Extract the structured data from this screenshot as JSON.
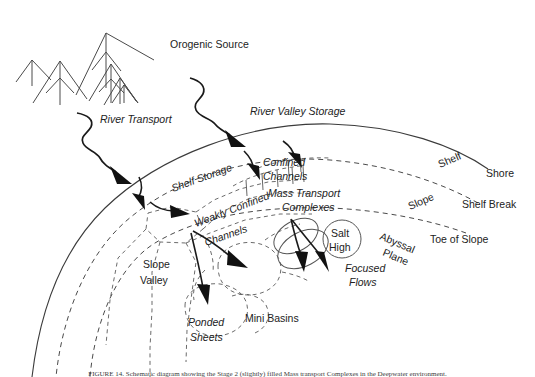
{
  "figure": {
    "caption": "FIGURE 14. Schematic diagram showing the Stage 2 (slightly) filled Mass transport Complexes in the Deepwater environment.",
    "colors": {
      "line": "#3b3b3b",
      "dashed": "#4a4a4a",
      "arrow": "#111111",
      "text": "#222222",
      "background": "#ffffff"
    }
  },
  "labels": {
    "orogenic_source": "Orogenic Source",
    "river_transport": "River Transport",
    "river_valley_storage": "River Valley Storage",
    "shelf_storage": "Shelf Storage",
    "confined_channels_line1": "Confined",
    "confined_channels_line2": "Channels",
    "mass_transport_line1": "Mass Transport",
    "mass_transport_line2": "Complexes",
    "weakly_confined_line1": "Weakly Confined",
    "weakly_confined_line2": "Channels",
    "slope_valley_line1": "Slope",
    "slope_valley_line2": "Valley",
    "ponded_sheets_line1": "Ponded",
    "ponded_sheets_line2": "Sheets",
    "mini_basins": "Mini Basins",
    "salt_high_line1": "Salt",
    "salt_high_line2": "High",
    "focused_flows_line1": "Focused",
    "focused_flows_line2": "Flows",
    "abyssal_plane_line1": "Abyssal",
    "abyssal_plane_line2": "Plane",
    "shelf": "Shelf",
    "shore": "Shore",
    "slope": "Slope",
    "shelf_break": "Shelf Break",
    "toe_of_slope": "Toe of Slope"
  },
  "zones": [
    {
      "name": "Shore",
      "type": "boundary-arc",
      "style": "solid"
    },
    {
      "name": "Shelf",
      "type": "region",
      "style": "solid-outer"
    },
    {
      "name": "Shelf Break",
      "type": "boundary-arc",
      "style": "dashed"
    },
    {
      "name": "Slope",
      "type": "region",
      "style": "dashed"
    },
    {
      "name": "Toe of Slope",
      "type": "boundary-arc",
      "style": "dashed"
    },
    {
      "name": "Abyssal Plane",
      "type": "region",
      "style": "open"
    }
  ],
  "features": [
    {
      "name": "Orogenic Source",
      "italic": false,
      "kind": "source"
    },
    {
      "name": "River Transport",
      "italic": true,
      "kind": "process"
    },
    {
      "name": "River Valley Storage",
      "italic": true,
      "kind": "storage"
    },
    {
      "name": "Shelf Storage",
      "italic": true,
      "kind": "storage"
    },
    {
      "name": "Confined Channels",
      "italic": true,
      "kind": "conduit"
    },
    {
      "name": "Weakly Confined Channels",
      "italic": true,
      "kind": "conduit"
    },
    {
      "name": "Mass Transport Complexes",
      "italic": true,
      "kind": "deposit"
    },
    {
      "name": "Slope Valley",
      "italic": false,
      "kind": "conduit"
    },
    {
      "name": "Ponded Sheets",
      "italic": true,
      "kind": "deposit"
    },
    {
      "name": "Mini Basins",
      "italic": false,
      "kind": "basin"
    },
    {
      "name": "Salt High",
      "italic": false,
      "kind": "structure"
    },
    {
      "name": "Focused Flows",
      "italic": true,
      "kind": "process"
    }
  ]
}
